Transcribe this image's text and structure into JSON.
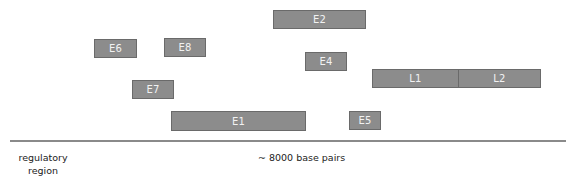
{
  "diagram": {
    "title": "",
    "colors": {
      "exon_fill": "#8c8c8c",
      "exon_border": "#6a6a6a",
      "exon_text": "#f2f2f2",
      "axis": "#8a8a8a"
    },
    "segments": [
      {
        "id": "E2",
        "label": "E2",
        "x": 273,
        "y": 10,
        "w": 93,
        "h": 19
      },
      {
        "id": "E6",
        "label": "E6",
        "x": 94,
        "y": 39,
        "w": 43,
        "h": 19
      },
      {
        "id": "E8",
        "label": "E8",
        "x": 164,
        "y": 38,
        "w": 42,
        "h": 19
      },
      {
        "id": "E4",
        "label": "E4",
        "x": 305,
        "y": 52,
        "w": 42,
        "h": 19
      },
      {
        "id": "L1",
        "label": "L1",
        "x": 372,
        "y": 69,
        "w": 87,
        "h": 19
      },
      {
        "id": "L2",
        "label": "L2",
        "x": 458,
        "y": 69,
        "w": 83,
        "h": 19
      },
      {
        "id": "E7",
        "label": "E7",
        "x": 132,
        "y": 80,
        "w": 42,
        "h": 19
      },
      {
        "id": "E1",
        "label": "E1",
        "x": 171,
        "y": 111,
        "w": 135,
        "h": 20
      },
      {
        "id": "E5",
        "label": "E5",
        "x": 349,
        "y": 111,
        "w": 32,
        "h": 19
      }
    ],
    "axis": {
      "left_label": "regulatory region",
      "left_label_lines": [
        "regulatory",
        "region"
      ],
      "scale_label": "~ 8000 base pairs"
    }
  }
}
